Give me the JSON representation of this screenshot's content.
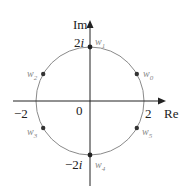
{
  "diagram": {
    "type": "complex-plane-roots",
    "axes": {
      "real_label": "Re",
      "imag_label": "Im"
    },
    "ticks": {
      "origin": "0",
      "pos_real": "2",
      "neg_real": "−2",
      "pos_imag_num": "2",
      "pos_imag_i": "i",
      "neg_imag_num": "−2",
      "neg_imag_i": "i"
    },
    "circle": {
      "radius": 2,
      "color": "#8a8a8a"
    },
    "points": [
      {
        "name": "w",
        "sub": "0",
        "angle_deg": 30
      },
      {
        "name": "w",
        "sub": "1",
        "angle_deg": 90
      },
      {
        "name": "w",
        "sub": "2",
        "angle_deg": 150
      },
      {
        "name": "w",
        "sub": "3",
        "angle_deg": 210
      },
      {
        "name": "w",
        "sub": "4",
        "angle_deg": 270
      },
      {
        "name": "w",
        "sub": "5",
        "angle_deg": 330
      }
    ],
    "colors": {
      "axis": "#222222",
      "circle": "#8a8a8a",
      "point": "#333333",
      "point_label": "#888888"
    }
  }
}
